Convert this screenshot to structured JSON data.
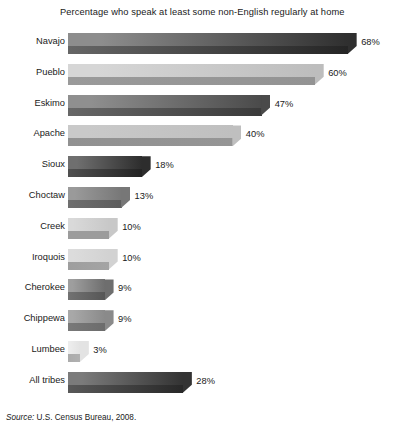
{
  "chart_data": {
    "type": "bar",
    "orientation": "horizontal",
    "title": "Percentage who speak at least some non-English regularly at home",
    "xlabel": "",
    "ylabel": "",
    "xlim": [
      0,
      75
    ],
    "grid": false,
    "legend": "none",
    "value_suffix": "%",
    "categories": [
      "Navajo",
      "Pueblo",
      "Eskimo",
      "Apache",
      "Sioux",
      "Choctaw",
      "Creek",
      "Iroquois",
      "Cherokee",
      "Chippewa",
      "Lumbee",
      "All tribes"
    ],
    "values": [
      68,
      60,
      47,
      40,
      18,
      13,
      10,
      10,
      9,
      9,
      3,
      28
    ],
    "value_labels": [
      "68%",
      "60%",
      "47%",
      "40%",
      "18%",
      "13%",
      "10%",
      "10%",
      "9%",
      "9%",
      "3%",
      "28%"
    ],
    "bar_colors_top": [
      "#8d8d8d",
      "#d6d6d6",
      "#8f8f8f",
      "#c9c9c9",
      "#6f6f6f",
      "#9a9a9a",
      "#d9d9d9",
      "#dcdcdc",
      "#9e9e9e",
      "#a8a8a8",
      "#ededed",
      "#7b7b7b"
    ],
    "bar_colors_end": [
      "#2f2f2f",
      "#bdbdbd",
      "#4a4a4a",
      "#bfbfbf",
      "#2d2d2d",
      "#777777",
      "#c8c8c8",
      "#d2d2d2",
      "#6e6e6e",
      "#8a8a8a",
      "#e3e3e3",
      "#333333"
    ]
  },
  "footer": {
    "source_word": "Source:",
    "source_text": " U.S. Census Bureau, 2008."
  },
  "colors": {
    "background": "#ffffff",
    "text": "#1a1a1a"
  }
}
